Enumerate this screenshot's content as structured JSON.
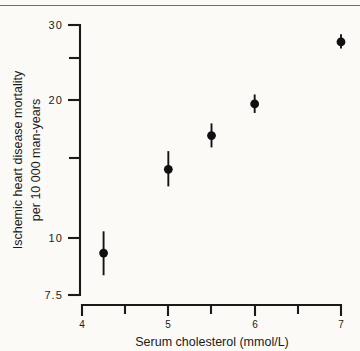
{
  "figure": {
    "background_color": "#fbfaf7",
    "ink_color": "#1a1a1a",
    "top_rule_color": "#6e6e6e"
  },
  "chart_data": {
    "type": "scatter",
    "title": "",
    "xlabel": "Serum cholesterol (mmol/L)",
    "ylabel": "Ischemic heart disease mortality\nper 10 000 man-years",
    "ylabel_line1": "Ischemic heart disease mortality",
    "ylabel_line2": "per 10 000 man-years",
    "xscale": "linear",
    "yscale": "log",
    "xlim": [
      4,
      7
    ],
    "ylim": [
      7.5,
      30
    ],
    "grid": false,
    "legend": false,
    "legend_position": "none",
    "xticks": [
      4,
      5,
      6,
      7
    ],
    "xtick_labels": [
      "4",
      "5",
      "6",
      "7"
    ],
    "xticks_minor": [
      4.5,
      5.5,
      6.5
    ],
    "yticks": [
      7.5,
      10,
      20,
      30
    ],
    "ytick_labels": [
      "7.5",
      "10",
      "20",
      "30"
    ],
    "yticks_minor": [
      15,
      25
    ],
    "marker": "filled-circle",
    "error_bars": "vertical",
    "x": [
      4.25,
      5.0,
      5.5,
      6.0,
      7.0
    ],
    "y": [
      9.3,
      14.3,
      17.0,
      20.0,
      27.5
    ],
    "y_low": [
      8.3,
      13.1,
      16.0,
      19.1,
      26.6
    ],
    "y_high": [
      10.4,
      15.7,
      18.1,
      21.0,
      28.6
    ],
    "points": [
      {
        "x": 4.25,
        "y": 9.3,
        "y_low": 8.3,
        "y_high": 10.4
      },
      {
        "x": 5.0,
        "y": 14.3,
        "y_low": 13.1,
        "y_high": 15.7
      },
      {
        "x": 5.5,
        "y": 17.0,
        "y_low": 16.0,
        "y_high": 18.1
      },
      {
        "x": 6.0,
        "y": 20.0,
        "y_low": 19.1,
        "y_high": 21.0
      },
      {
        "x": 7.0,
        "y": 27.5,
        "y_low": 26.6,
        "y_high": 28.6
      }
    ]
  }
}
